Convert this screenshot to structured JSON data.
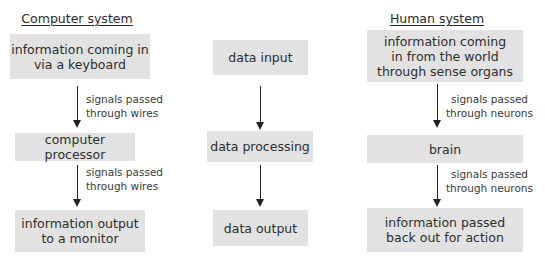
{
  "columns": {
    "computer": {
      "heading": "Computer system",
      "boxes": [
        {
          "line1": "information coming in",
          "line2": "via a keyboard"
        },
        {
          "line1": "computer processor"
        },
        {
          "line1": "information output",
          "line2": "to a monitor"
        }
      ],
      "arrows": [
        {
          "line1": "signals passed",
          "line2": "through wires"
        },
        {
          "line1": "signals passed",
          "line2": "through wires"
        }
      ]
    },
    "generic": {
      "boxes": [
        {
          "line1": "data input"
        },
        {
          "line1": "data processing"
        },
        {
          "line1": "data output"
        }
      ]
    },
    "human": {
      "heading": "Human system",
      "boxes": [
        {
          "line1": "information coming",
          "line2": "in from the world",
          "line3": "through sense organs"
        },
        {
          "line1": "brain"
        },
        {
          "line1": "information passed",
          "line2": "back out for action"
        }
      ],
      "arrows": [
        {
          "line1": "signals passed",
          "line2": "through neurons"
        },
        {
          "line1": "signals passed",
          "line2": "through neurons"
        }
      ]
    }
  },
  "colors": {
    "box_fill": "#e2e2e2",
    "text": "#2e2e2e",
    "arrow": "#222222"
  }
}
